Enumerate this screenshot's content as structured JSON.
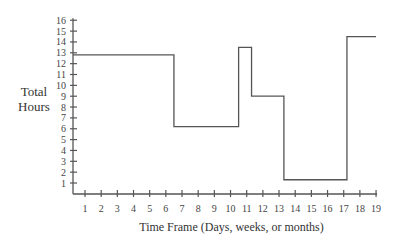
{
  "chart_data": {
    "type": "line",
    "style": "step",
    "title": "",
    "xlabel": "Time Frame (Days, weeks, or months)",
    "ylabel": "Total Hours",
    "ylabel_lines": [
      "Total",
      "Hours"
    ],
    "x_ticks": [
      1,
      2,
      3,
      4,
      5,
      6,
      7,
      8,
      9,
      10,
      11,
      12,
      13,
      14,
      15,
      16,
      17,
      18,
      19
    ],
    "y_ticks": [
      1,
      2,
      3,
      4,
      5,
      6,
      7,
      8,
      9,
      10,
      11,
      12,
      13,
      14,
      15,
      16
    ],
    "xlim": [
      0.2,
      19
    ],
    "ylim": [
      0.2,
      16
    ],
    "grid": false,
    "legend": null,
    "series": [
      {
        "name": "Total Hours",
        "steps": [
          {
            "x_start": 0.2,
            "x_end": 6.5,
            "y": 12.8
          },
          {
            "x_start": 6.5,
            "x_end": 10.5,
            "y": 6.2
          },
          {
            "x_start": 10.5,
            "x_end": 11.3,
            "y": 13.5
          },
          {
            "x_start": 11.3,
            "x_end": 13.3,
            "y": 9.0
          },
          {
            "x_start": 13.3,
            "x_end": 17.2,
            "y": 1.3
          },
          {
            "x_start": 17.2,
            "x_end": 19.0,
            "y": 14.5
          }
        ]
      }
    ]
  }
}
